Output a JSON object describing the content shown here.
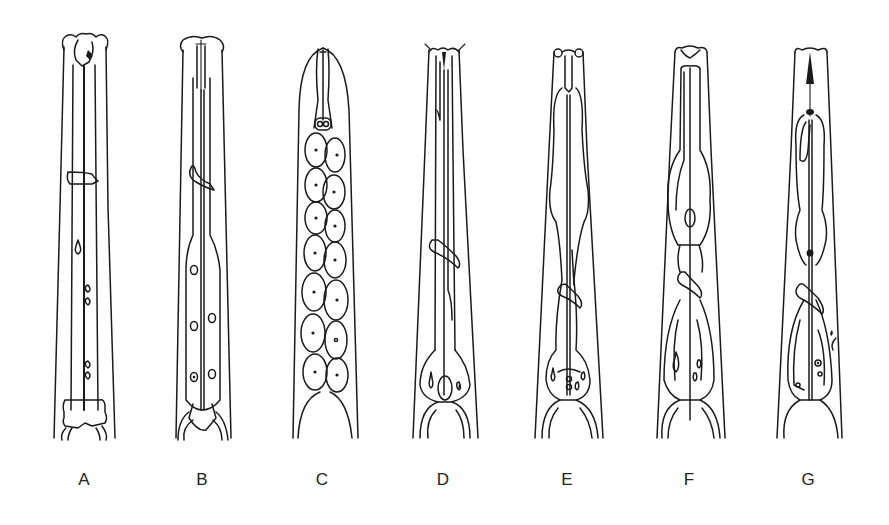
{
  "figure": {
    "type": "scientific-illustration",
    "line_color": "#1a1a1a",
    "background": "#ffffff",
    "panels": [
      {
        "label": "A",
        "x": 84
      },
      {
        "label": "B",
        "x": 202
      },
      {
        "label": "C",
        "x": 322
      },
      {
        "label": "D",
        "x": 443
      },
      {
        "label": "E",
        "x": 567
      },
      {
        "label": "F",
        "x": 689
      },
      {
        "label": "G",
        "x": 808
      }
    ]
  }
}
